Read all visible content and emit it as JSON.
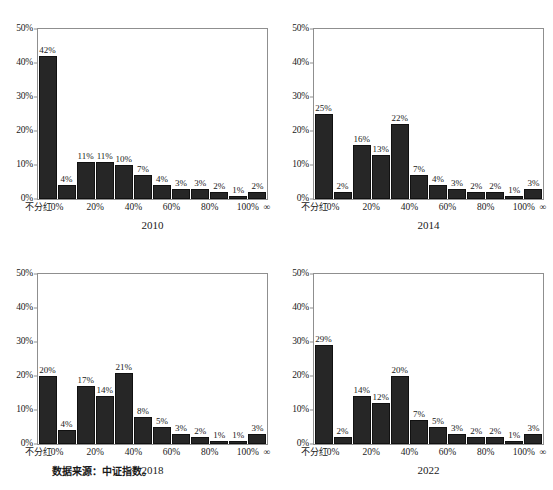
{
  "figure": {
    "caption": "数据来源：中证指数。",
    "bar_color": "#262626",
    "frame_color": "#8f8f8f",
    "background": "#ffffff"
  },
  "chart_data": [
    {
      "type": "bar",
      "title": "2010",
      "xlabel": "",
      "ylabel": "",
      "ylim": [
        0,
        50
      ],
      "yticks": [
        "0%",
        "10%",
        "20%",
        "30%",
        "40%",
        "50%"
      ],
      "ytick_values": [
        0,
        10,
        20,
        30,
        40,
        50
      ],
      "grid": false,
      "legend": "none",
      "xtick_labels": [
        "不分红",
        "0%",
        "20%",
        "40%",
        "60%",
        "80%",
        "100%",
        "∞"
      ],
      "xtick_positions": [
        0,
        1,
        3,
        5,
        7,
        9,
        11,
        12
      ],
      "categories": [
        "不分红",
        "0-10%",
        "10-20%",
        "20-30%",
        "30-40%",
        "40-50%",
        "50-60%",
        "60-70%",
        "70-80%",
        "80-90%",
        "90-100%",
        ">100%"
      ],
      "values": [
        42,
        4,
        11,
        11,
        10,
        7,
        4,
        3,
        3,
        2,
        1,
        2
      ],
      "data_labels": [
        "42%",
        "4%",
        "11%",
        "11%",
        "10%",
        "7%",
        "4%",
        "3%",
        "3%",
        "2%",
        "1%",
        "2%"
      ]
    },
    {
      "type": "bar",
      "title": "2014",
      "xlabel": "",
      "ylabel": "",
      "ylim": [
        0,
        50
      ],
      "yticks": [
        "0%",
        "10%",
        "20%",
        "30%",
        "40%",
        "50%"
      ],
      "ytick_values": [
        0,
        10,
        20,
        30,
        40,
        50
      ],
      "grid": false,
      "legend": "none",
      "xtick_labels": [
        "不分红",
        "0%",
        "20%",
        "40%",
        "60%",
        "80%",
        "100%",
        "∞"
      ],
      "xtick_positions": [
        0,
        1,
        3,
        5,
        7,
        9,
        11,
        12
      ],
      "categories": [
        "不分红",
        "0-10%",
        "10-20%",
        "20-30%",
        "30-40%",
        "40-50%",
        "50-60%",
        "60-70%",
        "70-80%",
        "80-90%",
        "90-100%",
        ">100%"
      ],
      "values": [
        25,
        2,
        16,
        13,
        22,
        7,
        4,
        3,
        2,
        2,
        1,
        3
      ],
      "data_labels": [
        "25%",
        "2%",
        "16%",
        "13%",
        "22%",
        "7%",
        "4%",
        "3%",
        "2%",
        "2%",
        "1%",
        "3%"
      ]
    },
    {
      "type": "bar",
      "title": "2018",
      "xlabel": "",
      "ylabel": "",
      "ylim": [
        0,
        50
      ],
      "yticks": [
        "0%",
        "10%",
        "20%",
        "30%",
        "40%",
        "50%"
      ],
      "ytick_values": [
        0,
        10,
        20,
        30,
        40,
        50
      ],
      "grid": false,
      "legend": "none",
      "xtick_labels": [
        "不分红",
        "0%",
        "20%",
        "40%",
        "60%",
        "80%",
        "100%",
        "∞"
      ],
      "xtick_positions": [
        0,
        1,
        3,
        5,
        7,
        9,
        11,
        12
      ],
      "categories": [
        "不分红",
        "0-10%",
        "10-20%",
        "20-30%",
        "30-40%",
        "40-50%",
        "50-60%",
        "60-70%",
        "70-80%",
        "80-90%",
        "90-100%",
        ">100%"
      ],
      "values": [
        20,
        4,
        17,
        14,
        21,
        8,
        5,
        3,
        2,
        1,
        1,
        3
      ],
      "data_labels": [
        "20%",
        "4%",
        "17%",
        "14%",
        "21%",
        "8%",
        "5%",
        "3%",
        "2%",
        "1%",
        "1%",
        "3%"
      ]
    },
    {
      "type": "bar",
      "title": "2022",
      "xlabel": "",
      "ylabel": "",
      "ylim": [
        0,
        50
      ],
      "yticks": [
        "0%",
        "10%",
        "20%",
        "30%",
        "40%",
        "50%"
      ],
      "ytick_values": [
        0,
        10,
        20,
        30,
        40,
        50
      ],
      "grid": false,
      "legend": "none",
      "xtick_labels": [
        "不分红",
        "0%",
        "20%",
        "40%",
        "60%",
        "80%",
        "100%",
        "∞"
      ],
      "xtick_positions": [
        0,
        1,
        3,
        5,
        7,
        9,
        11,
        12
      ],
      "categories": [
        "不分红",
        "0-10%",
        "10-20%",
        "20-30%",
        "30-40%",
        "40-50%",
        "50-60%",
        "60-70%",
        "70-80%",
        "80-90%",
        "90-100%",
        ">100%"
      ],
      "values": [
        29,
        2,
        14,
        12,
        20,
        7,
        5,
        3,
        2,
        2,
        1,
        3
      ],
      "data_labels": [
        "29%",
        "2%",
        "14%",
        "12%",
        "20%",
        "7%",
        "5%",
        "3%",
        "2%",
        "2%",
        "1%",
        "3%"
      ]
    }
  ]
}
